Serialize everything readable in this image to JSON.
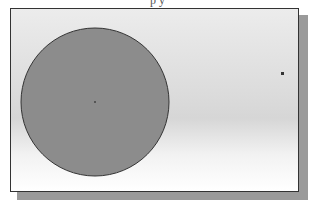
{
  "caption": "  p   y",
  "drawing": {
    "circle": {
      "cx": 95,
      "cy": 102,
      "r": 74,
      "fill": "#8c8c8c",
      "stroke": "#333333"
    },
    "center_point": {
      "x": 95,
      "y": 102
    },
    "point": {
      "x": 282,
      "y": 73
    }
  }
}
